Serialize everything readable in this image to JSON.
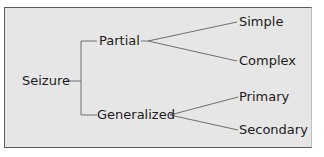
{
  "diagram": {
    "type": "tree",
    "root": {
      "label": "Seizure",
      "children": [
        {
          "label": "Partial",
          "children": [
            {
              "label": "Simple"
            },
            {
              "label": "Complex"
            }
          ]
        },
        {
          "label": "Generalized",
          "children": [
            {
              "label": "Primary"
            },
            {
              "label": "Secondary"
            }
          ]
        }
      ]
    },
    "colors": {
      "background": "#e6e6e6",
      "border": "#5a5a5a",
      "line": "#6e6e6e",
      "text": "#1c1c1c"
    }
  }
}
